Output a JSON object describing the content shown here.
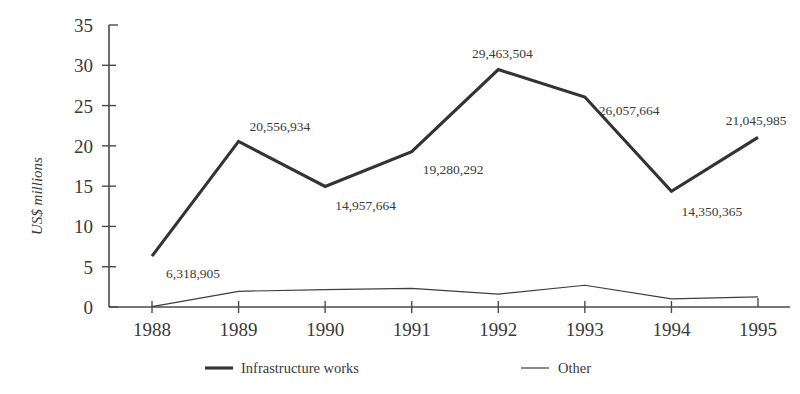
{
  "chart_data": {
    "type": "line",
    "title": "",
    "xlabel": "",
    "ylabel": "US$ millions",
    "categories": [
      "1988",
      "1989",
      "1990",
      "1991",
      "1992",
      "1993",
      "1994",
      "1995"
    ],
    "ylim": [
      0,
      35
    ],
    "yticks": [
      0,
      5,
      10,
      15,
      20,
      25,
      30,
      35
    ],
    "ytick_labels": [
      "0",
      "5",
      "10",
      "15",
      "20",
      "25",
      "30",
      "35"
    ],
    "grid": false,
    "legend_position": "bottom",
    "series": [
      {
        "name": "Infrastructure works",
        "style": "thick",
        "values": [
          6.318905,
          20.556934,
          14.957664,
          19.280292,
          29.463504,
          26.057664,
          14.350365,
          21.045985
        ],
        "point_labels": [
          "6,318,905",
          "20,556,934",
          "14,957,664",
          "19,280,292",
          "29,463,504",
          "26,057,664",
          "14,350,365",
          "21,045,985"
        ]
      },
      {
        "name": "Other",
        "style": "thin",
        "values": [
          0.05,
          1.95,
          2.15,
          2.3,
          1.6,
          2.7,
          1.0,
          1.25
        ],
        "point_labels": [
          "",
          "",
          "",
          "",
          "",
          "",
          "",
          ""
        ]
      }
    ]
  },
  "axis": {
    "y_title": "US$ millions"
  },
  "legend": {
    "items": [
      {
        "label": "Infrastructure works",
        "style": "thick"
      },
      {
        "label": "Other",
        "style": "thin"
      }
    ]
  },
  "colors": {
    "background": "#ffffff",
    "axis": "#4a4a4a",
    "series_thick": "#333333",
    "series_thin": "#3d3d3d",
    "text": "#3a3a3a"
  }
}
